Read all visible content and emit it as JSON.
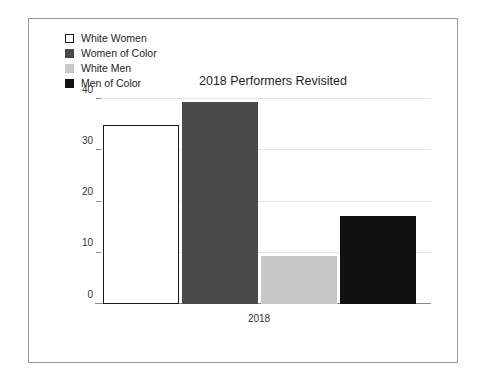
{
  "chart_data": {
    "type": "bar",
    "title": "2018 Performers Revisited",
    "xlabel": "2018",
    "ylabel": "",
    "categories": [
      "2018"
    ],
    "grid": true,
    "legend_position": "top-left",
    "ylim": [
      0,
      40
    ],
    "yticks": [
      0,
      10,
      20,
      30,
      40
    ],
    "ytick_labels": [
      "0",
      "10",
      "20",
      "30",
      "40"
    ],
    "series": [
      {
        "name": "White Women",
        "values": [
          35
        ],
        "color": "#ffffff",
        "border": "#1a1a1a"
      },
      {
        "name": "Women of Color",
        "values": [
          39.5
        ],
        "color": "#4a4a4a",
        "border": "#4a4a4a"
      },
      {
        "name": "White Men",
        "values": [
          9.4
        ],
        "color": "#c8c8c8",
        "border": "#c8c8c8"
      },
      {
        "name": "Men of Color",
        "values": [
          17.2
        ],
        "color": "#111111",
        "border": "#111111"
      }
    ]
  },
  "legend": {
    "items": [
      {
        "label": "White Women",
        "swatch": "#ffffff",
        "swatch_border": "#1a1a1a"
      },
      {
        "label": "Women of Color",
        "swatch": "#4a4a4a",
        "swatch_border": "#4a4a4a"
      },
      {
        "label": "White Men",
        "swatch": "#c8c8c8",
        "swatch_border": "#c8c8c8"
      },
      {
        "label": "Men of Color",
        "swatch": "#111111",
        "swatch_border": "#111111"
      }
    ]
  }
}
